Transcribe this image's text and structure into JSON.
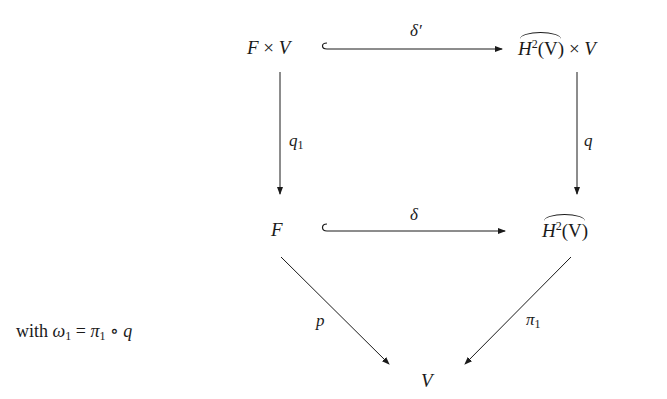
{
  "diagram": {
    "type": "commutative-diagram",
    "nodes": {
      "top_left": {
        "base": "F",
        "times": "×",
        "factor": "V"
      },
      "top_right": {
        "base": "H",
        "sup": "2",
        "arg": "(V)",
        "times": "×",
        "factor": "V",
        "hat": true
      },
      "mid_left": {
        "text": "F"
      },
      "mid_right": {
        "base": "H",
        "sup": "2",
        "arg": "(V)",
        "hat": true
      },
      "bottom": {
        "text": "V"
      }
    },
    "arrows": {
      "top": {
        "label": "δ′",
        "kind": "inclusion",
        "from": "top_left",
        "to": "top_right"
      },
      "middle": {
        "label": "δ",
        "kind": "inclusion",
        "from": "mid_left",
        "to": "mid_right"
      },
      "left_vertical": {
        "label_base": "q",
        "label_sub": "1",
        "from": "top_left",
        "to": "mid_left"
      },
      "right_vertical": {
        "label": "q",
        "from": "top_right",
        "to": "mid_right"
      },
      "left_diagonal": {
        "label": "p",
        "from": "mid_left",
        "to": "bottom"
      },
      "right_diagonal": {
        "label_base": "π",
        "label_sub": "1",
        "from": "mid_right",
        "to": "bottom"
      }
    },
    "note": {
      "prefix": "with",
      "lhs_base": "ω",
      "lhs_sub": "1",
      "eq": "=",
      "rhs_base": "π",
      "rhs_sub": "1",
      "compose": "∘",
      "rhs_tail": "q"
    }
  }
}
